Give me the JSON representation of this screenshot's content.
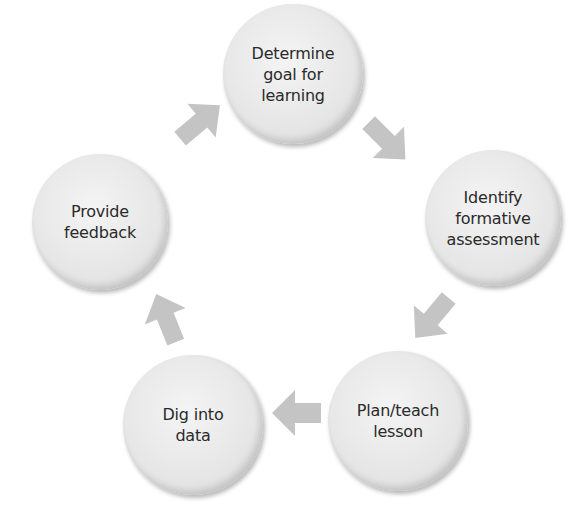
{
  "diagram": {
    "type": "cycle",
    "arrow_color": "#c4c4c4",
    "node_color": "#e6e6e6",
    "nodes": [
      {
        "id": "goal",
        "label": "Determine\ngoal for\nlearning",
        "cx": 293,
        "cy": 74,
        "r": 70
      },
      {
        "id": "assessment",
        "label": "Identify\nformative\nassessment",
        "cx": 493,
        "cy": 218,
        "r": 68
      },
      {
        "id": "teach",
        "label": "Plan/teach\nlesson",
        "cx": 398,
        "cy": 421,
        "r": 70
      },
      {
        "id": "data",
        "label": "Dig into\ndata",
        "cx": 193,
        "cy": 425,
        "r": 70
      },
      {
        "id": "feedback",
        "label": "Provide\nfeedback",
        "cx": 100,
        "cy": 222,
        "r": 68
      }
    ],
    "edges": [
      {
        "from": "goal",
        "to": "assessment"
      },
      {
        "from": "assessment",
        "to": "teach"
      },
      {
        "from": "teach",
        "to": "data"
      },
      {
        "from": "data",
        "to": "feedback"
      },
      {
        "from": "feedback",
        "to": "goal"
      }
    ]
  }
}
